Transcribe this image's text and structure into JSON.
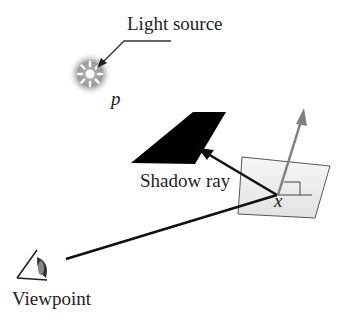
{
  "diagram": {
    "title": "",
    "labels": {
      "light_source": "Light source",
      "point_p": "p",
      "shadow_ray": "Shadow ray",
      "point_x": "x",
      "viewpoint": "Viewpoint"
    },
    "elements": [
      {
        "id": "light-source",
        "type": "glowing light icon",
        "label": "Light source"
      },
      {
        "id": "occluder",
        "type": "black parallelogram (occluding object)"
      },
      {
        "id": "surface-patch",
        "type": "light gray parallelogram surface"
      },
      {
        "id": "normal-vector",
        "type": "gray arrow perpendicular to surface"
      },
      {
        "id": "shadow-ray",
        "type": "black arrow from x toward occluder",
        "label": "Shadow ray"
      },
      {
        "id": "view-ray",
        "type": "black line from viewpoint to x"
      },
      {
        "id": "eye",
        "type": "eye icon",
        "label": "Viewpoint"
      }
    ],
    "colors": {
      "occluder": "#000000",
      "surface_fill": "#ededed",
      "normal_arrow": "#808080",
      "ray": "#111111"
    }
  }
}
